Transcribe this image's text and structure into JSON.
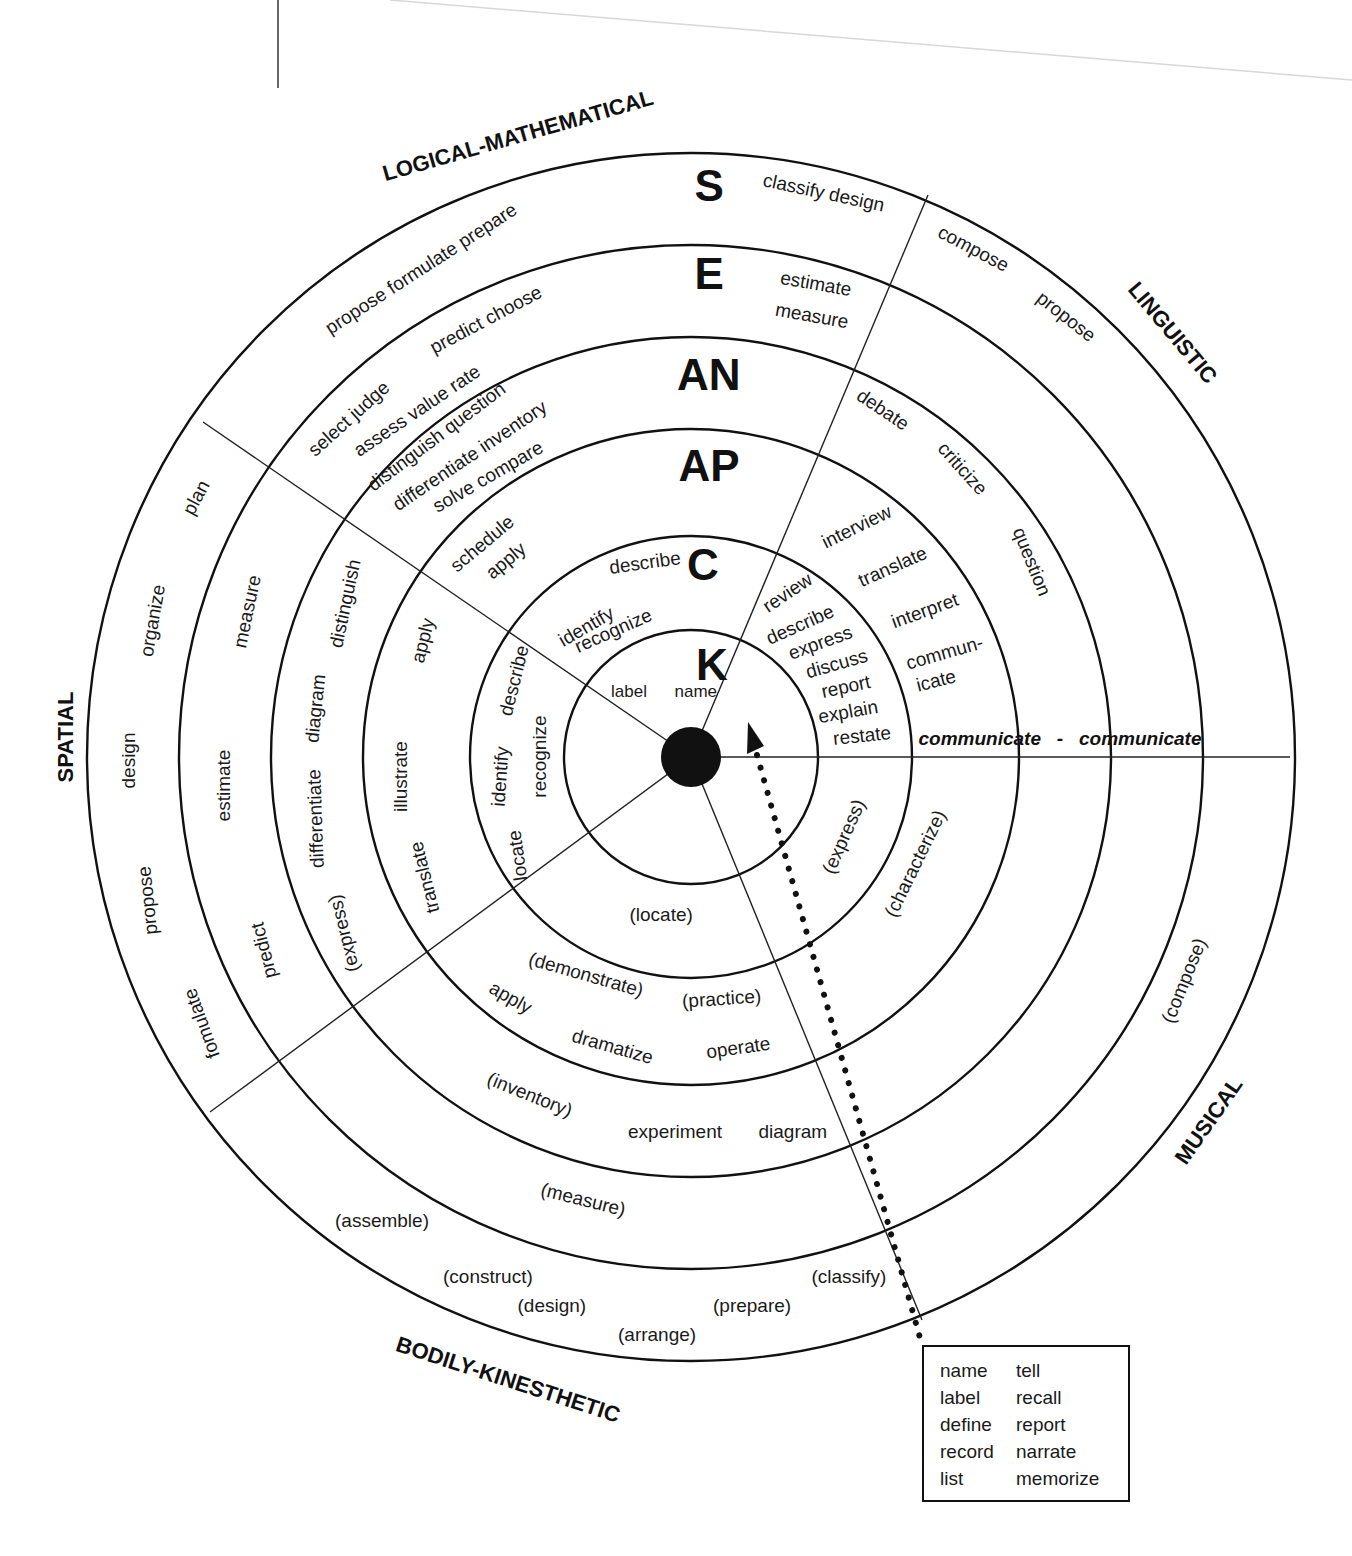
{
  "diagram": {
    "center": {
      "x": 691,
      "y": 757
    },
    "rings": [
      127,
      221,
      328,
      420,
      512,
      604
    ],
    "levels": [
      {
        "id": "K",
        "label": "K",
        "x": 712,
        "y": 665
      },
      {
        "id": "C",
        "label": "C",
        "x": 703,
        "y": 565
      },
      {
        "id": "AP",
        "label": "AP",
        "x": 709,
        "y": 466
      },
      {
        "id": "AN",
        "label": "AN",
        "x": 709,
        "y": 375
      },
      {
        "id": "E",
        "label": "E",
        "x": 709,
        "y": 274
      },
      {
        "id": "S",
        "label": "S",
        "x": 709,
        "y": 186
      }
    ],
    "intelligences": [
      {
        "id": "logical-mathematical",
        "label": "LOGICAL-MATHEMATICAL",
        "x": 518,
        "y": 136,
        "rot": -16
      },
      {
        "id": "linguistic",
        "label": "LINGUISTIC",
        "x": 1172,
        "y": 333,
        "rot": 50
      },
      {
        "id": "spatial",
        "label": "SPATIAL",
        "x": 66,
        "y": 737,
        "rot": -90
      },
      {
        "id": "musical",
        "label": "MUSICAL",
        "x": 1209,
        "y": 1121,
        "rot": -55
      },
      {
        "id": "bodily-kinesthetic",
        "label": "BODILY-KINESTHETIC",
        "x": 508,
        "y": 1380,
        "rot": 18
      }
    ],
    "words": [
      {
        "t": "classify design",
        "x": 824,
        "y": 192,
        "rot": 12
      },
      {
        "t": "propose formulate prepare",
        "x": 421,
        "y": 268,
        "rot": -33
      },
      {
        "t": "estimate",
        "x": 816,
        "y": 283,
        "rot": 10
      },
      {
        "t": "measure",
        "x": 812,
        "y": 315,
        "rot": 10
      },
      {
        "t": "predict choose",
        "x": 486,
        "y": 319,
        "rot": -28
      },
      {
        "t": "select judge",
        "x": 348,
        "y": 418,
        "rot": -42
      },
      {
        "t": "assess value rate",
        "x": 417,
        "y": 410,
        "rot": -34
      },
      {
        "t": "distinguish question",
        "x": 436,
        "y": 436,
        "rot": -37
      },
      {
        "t": "differentiate inventory",
        "x": 469,
        "y": 455,
        "rot": -34
      },
      {
        "t": "solve compare",
        "x": 488,
        "y": 476,
        "rot": -30
      },
      {
        "t": "schedule",
        "x": 482,
        "y": 543,
        "rot": -40
      },
      {
        "t": "apply",
        "x": 505,
        "y": 560,
        "rot": -40
      },
      {
        "t": "describe",
        "x": 645,
        "y": 562,
        "rot": -8
      },
      {
        "t": "identify",
        "x": 586,
        "y": 626,
        "rot": -30
      },
      {
        "t": "recognize",
        "x": 613,
        "y": 630,
        "rot": -24
      },
      {
        "t": "label",
        "x": 629,
        "y": 691,
        "rot": 0,
        "small": true
      },
      {
        "t": "name",
        "x": 696,
        "y": 691,
        "rot": 0,
        "small": true
      },
      {
        "t": "compose",
        "x": 973,
        "y": 248,
        "rot": 28
      },
      {
        "t": "propose",
        "x": 1066,
        "y": 316,
        "rot": 38
      },
      {
        "t": "debate",
        "x": 883,
        "y": 409,
        "rot": 34
      },
      {
        "t": "criticize",
        "x": 962,
        "y": 468,
        "rot": 48
      },
      {
        "t": "question",
        "x": 1032,
        "y": 561,
        "rot": 68
      },
      {
        "t": "interview",
        "x": 856,
        "y": 526,
        "rot": -26
      },
      {
        "t": "translate",
        "x": 892,
        "y": 566,
        "rot": -24
      },
      {
        "t": "interpret",
        "x": 925,
        "y": 610,
        "rot": -20
      },
      {
        "t": "commun-",
        "x": 944,
        "y": 652,
        "rot": -16
      },
      {
        "t": "icate",
        "x": 936,
        "y": 680,
        "rot": -14
      },
      {
        "t": "review",
        "x": 787,
        "y": 592,
        "rot": -34
      },
      {
        "t": "describe",
        "x": 800,
        "y": 624,
        "rot": -24
      },
      {
        "t": "express",
        "x": 820,
        "y": 642,
        "rot": -20
      },
      {
        "t": "discuss",
        "x": 836,
        "y": 663,
        "rot": -16
      },
      {
        "t": "report",
        "x": 846,
        "y": 686,
        "rot": -12
      },
      {
        "t": "explain",
        "x": 848,
        "y": 711,
        "rot": -10
      },
      {
        "t": "restate",
        "x": 862,
        "y": 735,
        "rot": -6
      },
      {
        "t": "plan",
        "x": 196,
        "y": 497,
        "rot": -62
      },
      {
        "t": "organize",
        "x": 152,
        "y": 620,
        "rot": -80
      },
      {
        "t": "design",
        "x": 128,
        "y": 760,
        "rot": -90
      },
      {
        "t": "propose",
        "x": 147,
        "y": 900,
        "rot": -96
      },
      {
        "t": "fomulate",
        "x": 201,
        "y": 1023,
        "rot": -110
      },
      {
        "t": "measure",
        "x": 247,
        "y": 611,
        "rot": -78
      },
      {
        "t": "estimate",
        "x": 224,
        "y": 785,
        "rot": -90
      },
      {
        "t": "predict",
        "x": 263,
        "y": 950,
        "rot": -104
      },
      {
        "t": "distinguish",
        "x": 345,
        "y": 603,
        "rot": -78
      },
      {
        "t": "diagram",
        "x": 315,
        "y": 708,
        "rot": -84
      },
      {
        "t": "differentiate",
        "x": 315,
        "y": 818,
        "rot": -92
      },
      {
        "t": "(express)",
        "x": 343,
        "y": 933,
        "rot": -104
      },
      {
        "t": "apply",
        "x": 422,
        "y": 640,
        "rot": -76
      },
      {
        "t": "illustrate",
        "x": 400,
        "y": 776,
        "rot": -90
      },
      {
        "t": "translate",
        "x": 424,
        "y": 877,
        "rot": -104
      },
      {
        "t": "describe",
        "x": 514,
        "y": 680,
        "rot": -76
      },
      {
        "t": "identify",
        "x": 500,
        "y": 776,
        "rot": -86
      },
      {
        "t": "locate",
        "x": 517,
        "y": 855,
        "rot": -98
      },
      {
        "t": "recognize",
        "x": 539,
        "y": 756,
        "rot": -90
      },
      {
        "t": "(locate)",
        "x": 661,
        "y": 914,
        "rot": 0
      },
      {
        "t": "(demonstrate)",
        "x": 586,
        "y": 974,
        "rot": 16
      },
      {
        "t": "(practice)",
        "x": 721,
        "y": 998,
        "rot": -4
      },
      {
        "t": "apply",
        "x": 510,
        "y": 997,
        "rot": 30
      },
      {
        "t": "dramatize",
        "x": 612,
        "y": 1046,
        "rot": 16
      },
      {
        "t": "operate",
        "x": 738,
        "y": 1047,
        "rot": -8
      },
      {
        "t": "(inventory)",
        "x": 530,
        "y": 1094,
        "rot": 22
      },
      {
        "t": "experiment",
        "x": 675,
        "y": 1131,
        "rot": 0
      },
      {
        "t": "diagram",
        "x": 793,
        "y": 1131,
        "rot": 0
      },
      {
        "t": "(express)",
        "x": 843,
        "y": 836,
        "rot": -66
      },
      {
        "t": "(characterize)",
        "x": 915,
        "y": 863,
        "rot": -64
      },
      {
        "t": "(compose)",
        "x": 1184,
        "y": 980,
        "rot": -68
      },
      {
        "t": "(measure)",
        "x": 583,
        "y": 1199,
        "rot": 14
      },
      {
        "t": "(assemble)",
        "x": 382,
        "y": 1220,
        "rot": 0
      },
      {
        "t": "(construct)",
        "x": 488,
        "y": 1276,
        "rot": 0
      },
      {
        "t": "(design)",
        "x": 552,
        "y": 1305,
        "rot": 0
      },
      {
        "t": "(arrange)",
        "x": 657,
        "y": 1334,
        "rot": 0
      },
      {
        "t": "(prepare)",
        "x": 752,
        "y": 1305,
        "rot": 0
      },
      {
        "t": "(classify)",
        "x": 849,
        "y": 1276,
        "rot": 0
      }
    ],
    "communicate": {
      "t": "communicate - communicate",
      "x": 1060,
      "y": 738,
      "rot": 0
    }
  },
  "legend": {
    "col1": [
      "name",
      "label",
      "define",
      "record",
      "list"
    ],
    "col2": [
      "tell",
      "recall",
      "report",
      "narrate",
      "memorize"
    ]
  }
}
